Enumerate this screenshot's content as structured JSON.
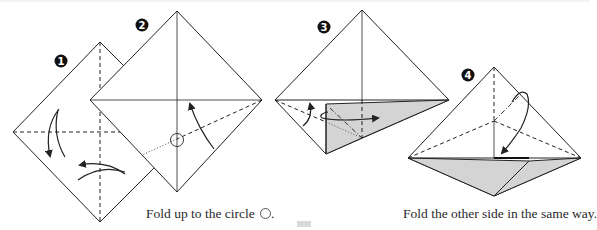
{
  "steps": [
    {
      "number": "1",
      "badge_label": "❶"
    },
    {
      "number": "2",
      "badge_label": "❷"
    },
    {
      "number": "3",
      "badge_label": "❸"
    },
    {
      "number": "4",
      "badge_label": "❹"
    }
  ],
  "captions": {
    "step2": "Fold up to the circle",
    "step2_suffix": ".",
    "step4": "Fold the other side in the same way."
  },
  "icons": {
    "circle_marker": "circle-outline",
    "valley_fold_arrow": "curved-arrow",
    "mountain_fold_arrow": "loop-arrow"
  },
  "colors": {
    "line": "#222222",
    "shade": "#d4d4d4",
    "badge": "#111111",
    "text": "#2a2a2a"
  }
}
